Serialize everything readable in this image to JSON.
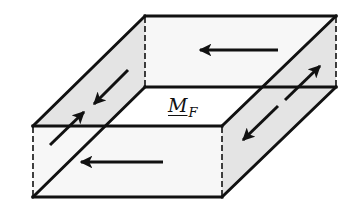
{
  "diagram": {
    "type": "3D slab with force/moment arrows",
    "label": {
      "main": "M",
      "subscript": "F"
    },
    "colors": {
      "line": "#111111",
      "face_shade": "#e6e6e6",
      "face_light": "#f7f7f7",
      "background": "#ffffff"
    },
    "arrows": [
      {
        "face": "back",
        "direction": "left"
      },
      {
        "face": "front",
        "direction": "left"
      },
      {
        "face": "left",
        "direction": "converging",
        "note": "two arrows pointing toward each other"
      },
      {
        "face": "right",
        "direction": "diverging",
        "note": "two arrows pointing away from each other"
      }
    ]
  }
}
